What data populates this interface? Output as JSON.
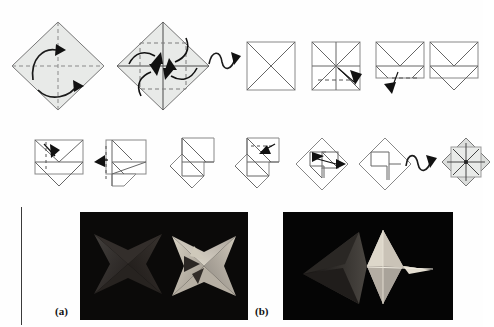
{
  "figure": {
    "kind": "origami-folding-instructions",
    "title_text": "",
    "rows": 2,
    "panel_labels": [
      "(a)",
      "(b)"
    ]
  },
  "row1": {
    "steps": [
      {
        "id": "step-1",
        "name": "square-diamond-creased",
        "shape": "diamond",
        "fill": "#e6e8e6",
        "creases": [
          "vertical-dashed",
          "horizontal-dashed"
        ],
        "arrows": [
          "curved-arrow-up-left",
          "curved-arrow-down-right"
        ],
        "caption": ""
      },
      {
        "id": "step-2",
        "name": "diamond-corners-to-center",
        "shape": "diamond",
        "fill": "#e6e8e6",
        "creases": [
          "vertical-solid",
          "horizontal-solid",
          "inner-square-dashed"
        ],
        "arrows": [
          "fold-arrow-nw",
          "fold-arrow-ne",
          "fold-arrow-sw",
          "fold-arrow-se"
        ],
        "caption": ""
      },
      {
        "id": "flip-symbol-1",
        "name": "turn-over-symbol",
        "shape": "loop-arrow",
        "caption": ""
      },
      {
        "id": "step-3",
        "name": "square-with-diagonals",
        "shape": "square",
        "fill": "#ffffff",
        "creases": [
          "diagonal-both"
        ],
        "arrows": [],
        "caption": ""
      },
      {
        "id": "step-4",
        "name": "square-with-diagonals-and-midlines",
        "shape": "square",
        "fill": "#ffffff",
        "creases": [
          "diagonal-both",
          "vertical-mid",
          "horizontal-mid",
          "lower-dashed"
        ],
        "arrows": [
          "fold-arrow-se"
        ],
        "caption": ""
      },
      {
        "id": "step-5",
        "name": "folded-rectangle-with-v",
        "shape": "rectangle",
        "fill": "#ffffff",
        "creases": [
          "v-fold",
          "horizontal-mid",
          "lower-dashed"
        ],
        "arrows": [
          "fold-arrow-down"
        ],
        "caption": ""
      },
      {
        "id": "step-6",
        "name": "rectangle-with-double-v",
        "shape": "rectangle",
        "fill": "#ffffff",
        "creases": [
          "v-fold-upper",
          "v-fold-lower"
        ],
        "arrows": [],
        "caption": ""
      }
    ]
  },
  "row2": {
    "steps": [
      {
        "id": "step-7",
        "name": "rectangle-fold-left-flap",
        "shape": "rectangle",
        "fill": "#ffffff",
        "arrows": [
          "fold-arrow-down-right"
        ],
        "caption": ""
      },
      {
        "id": "step-8",
        "name": "partial-fold-left",
        "shape": "rectangle-stepped",
        "fill": "#ffffff",
        "arrows": [
          "fold-arrow-left"
        ],
        "caption": ""
      },
      {
        "id": "step-9",
        "name": "pinwheel-forming",
        "shape": "pinwheel",
        "fill": "#ffffff",
        "arrows": [],
        "caption": ""
      },
      {
        "id": "step-10",
        "name": "pinwheel-with-fold-arrow",
        "shape": "pinwheel",
        "fill": "#ffffff",
        "arrows": [
          "fold-arrow-left-small"
        ],
        "caption": ""
      },
      {
        "id": "step-11",
        "name": "diamond-pinwheel-fold",
        "shape": "diamond-pinwheel",
        "fill": "#ffffff",
        "arrows": [
          "fold-arrow-right"
        ],
        "caption": ""
      },
      {
        "id": "step-12",
        "name": "diamond-pinwheel-complete",
        "shape": "diamond-pinwheel",
        "fill": "#ffffff",
        "arrows": [],
        "caption": ""
      },
      {
        "id": "flip-symbol-2",
        "name": "turn-over-symbol",
        "shape": "loop-arrow",
        "caption": ""
      },
      {
        "id": "step-13",
        "name": "finished-star-diamond",
        "shape": "diamond",
        "fill": "#d9dbd9",
        "arrows": [
          "radial-arrows-8"
        ],
        "caption": ""
      }
    ]
  },
  "photos": [
    {
      "id": "photo-a",
      "label": "(a)",
      "background": "#0a0a0a",
      "description": "two folded paper star modules, one dark one light",
      "objects": [
        "dark-four-point-star",
        "light-pinwheel-star"
      ]
    },
    {
      "id": "photo-b",
      "label": "(b)",
      "background": "#050505",
      "description": "assembled star seen edge-on and face-on",
      "objects": [
        "dark-side-profile-star",
        "light-eight-point-star"
      ]
    }
  ],
  "colors": {
    "paper_gray": "#e6e8e6",
    "line": "#555555",
    "crease": "#666666",
    "photo_dark": "#0a0a0a",
    "label_text": "#111111",
    "rule": "#3a3a3a"
  }
}
